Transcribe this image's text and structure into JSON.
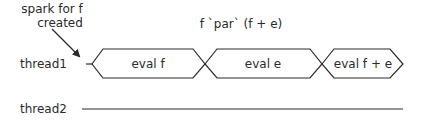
{
  "diagram": {
    "annotation": {
      "line1": "spark for f",
      "line2": "created"
    },
    "expression": "f `par` (f + e)",
    "threads": [
      {
        "label": "thread1",
        "segments": [
          {
            "label": "eval f"
          },
          {
            "label": "eval e"
          },
          {
            "label": "eval f + e"
          }
        ]
      },
      {
        "label": "thread2",
        "segments": []
      }
    ],
    "colors": {
      "stroke": "#2a2a2a",
      "background": "#ffffff"
    }
  }
}
